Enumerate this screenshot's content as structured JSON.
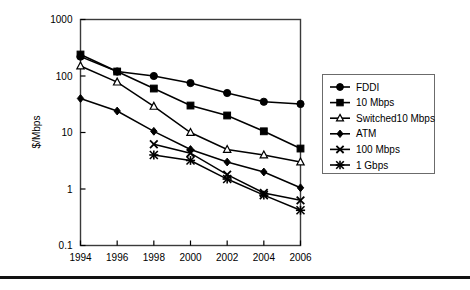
{
  "chart_data": {
    "type": "line",
    "title": "",
    "xlabel": "",
    "ylabel": "$/Mbps",
    "x": [
      1994,
      1996,
      1998,
      2000,
      2002,
      2004,
      2006
    ],
    "categories": [
      "1994",
      "1996",
      "1998",
      "2000",
      "2002",
      "2004",
      "2006"
    ],
    "xtick_labels": [
      "1994",
      "1996",
      "1998",
      "2000",
      "2002",
      "2004",
      "2006"
    ],
    "ytick_labels": [
      "1000",
      "100",
      "10",
      "1",
      "0.1"
    ],
    "ytick_values": [
      1000,
      100,
      10,
      1,
      0.1
    ],
    "yscale": "log",
    "ylim": [
      0.1,
      1000
    ],
    "xlim": [
      1994,
      2006
    ],
    "grid": false,
    "legend_position": "right",
    "series": [
      {
        "name": "FDDI",
        "marker": "filled-circle",
        "x": [
          1994,
          1996,
          1998,
          2000,
          2002,
          2004,
          2006
        ],
        "values": [
          220,
          120,
          100,
          75,
          50,
          35,
          32
        ]
      },
      {
        "name": "10 Mbps",
        "marker": "filled-square",
        "x": [
          1994,
          1996,
          1998,
          2000,
          2002,
          2004,
          2006
        ],
        "values": [
          240,
          120,
          60,
          30,
          20,
          10.5,
          5.2
        ]
      },
      {
        "name": "Switched10 Mbps",
        "marker": "hollow-triangle",
        "x": [
          1994,
          1996,
          1998,
          2000,
          2002,
          2004,
          2006
        ],
        "values": [
          150,
          78,
          29,
          10,
          5,
          4,
          3
        ]
      },
      {
        "name": "ATM",
        "marker": "filled-diamond",
        "x": [
          1994,
          1996,
          1998,
          2000,
          2002,
          2004,
          2006
        ],
        "values": [
          40,
          24,
          10.5,
          5,
          3,
          2,
          1.05
        ]
      },
      {
        "name": "100 Mbps",
        "marker": "cross-x",
        "x": [
          1998,
          2000,
          2002,
          2004,
          2006
        ],
        "values": [
          6.2,
          4.3,
          1.8,
          0.85,
          0.63
        ]
      },
      {
        "name": "1 Gbps",
        "marker": "asterisk",
        "x": [
          1998,
          2000,
          2002,
          2004,
          2006
        ],
        "values": [
          4,
          3.2,
          1.5,
          0.78,
          0.42
        ]
      }
    ]
  },
  "axes": {
    "ylabel": "$/Mbps",
    "ytick_labels": [
      "1000",
      "100",
      "10",
      "1",
      "0.1"
    ],
    "xtick_labels": [
      "1994",
      "1996",
      "1998",
      "2000",
      "2002",
      "2004",
      "2006"
    ]
  },
  "legend": {
    "items": [
      {
        "label": "FDDI"
      },
      {
        "label": "10 Mbps"
      },
      {
        "label": "Switched10 Mbps"
      },
      {
        "label": "ATM"
      },
      {
        "label": "100 Mbps"
      },
      {
        "label": "1 Gbps"
      }
    ]
  },
  "colors": {
    "ink": "#000000",
    "frame": "#3a3a3a",
    "rule": "#111111"
  }
}
